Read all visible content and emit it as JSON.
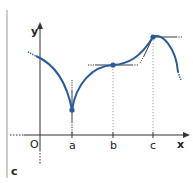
{
  "diagram": {
    "panel_label": "c",
    "axes": {
      "x_label": "x",
      "y_label": "y",
      "origin_label": "O"
    },
    "ticks": [
      {
        "label": "a"
      },
      {
        "label": "b"
      },
      {
        "label": "c"
      }
    ],
    "colors": {
      "curve": "#2a5a9a",
      "axis": "#333333",
      "tangent": "#222222",
      "border": "#bbbbbb"
    },
    "features": [
      {
        "at": "a",
        "type": "cusp",
        "tangent": "vertical"
      },
      {
        "at": "b",
        "type": "inflection",
        "tangent": "horizontal"
      },
      {
        "at": "c",
        "type": "corner",
        "tangents": [
          "horizontal",
          "sloped"
        ]
      }
    ]
  }
}
